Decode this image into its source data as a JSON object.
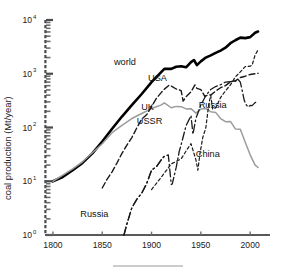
{
  "figure": {
    "background": "#ffffff",
    "rule_color": "#b9bbbd",
    "axis_color": "#58595b"
  },
  "chart_data": {
    "type": "line",
    "title": "",
    "subtitle": "",
    "xlabel": "",
    "ylabel": "coal production (Mt/year)",
    "yscale": "log",
    "xscale": "linear",
    "xlim": [
      1795,
      2012
    ],
    "ylim": [
      1,
      10000
    ],
    "grid": false,
    "legend": "inline-annotations",
    "xticks": [
      1800,
      1850,
      1900,
      1950,
      2000
    ],
    "xtick_labels": [
      "1800",
      "1850",
      "1900",
      "1950",
      "2000"
    ],
    "yticks": [
      1,
      10,
      100,
      1000,
      10000
    ],
    "ytick_labels": [
      "10⁰",
      "10¹",
      "10²",
      "10³",
      "10⁴"
    ],
    "ytick_mantissa": [
      "10",
      "10",
      "10",
      "10",
      "10"
    ],
    "ytick_exponent": [
      "0",
      "1",
      "2",
      "3",
      "4"
    ],
    "series": [
      {
        "name": "world",
        "label": "world",
        "color": "#000000",
        "width": 2.6,
        "dash": "none",
        "label_x": 1873,
        "label_y": 1450,
        "x": [
          1800,
          1810,
          1820,
          1830,
          1840,
          1850,
          1860,
          1870,
          1880,
          1890,
          1900,
          1910,
          1913,
          1920,
          1925,
          1930,
          1935,
          1940,
          1943,
          1946,
          1950,
          1955,
          1960,
          1965,
          1970,
          1975,
          1980,
          1985,
          1990,
          1995,
          2000,
          2005,
          2008
        ],
        "y": [
          10,
          12,
          16,
          22,
          33,
          55,
          95,
          160,
          260,
          420,
          700,
          1080,
          1230,
          1230,
          1350,
          1380,
          1320,
          1650,
          1800,
          1450,
          1700,
          2000,
          2200,
          2450,
          2700,
          3050,
          3700,
          4200,
          4700,
          4600,
          4800,
          5800,
          6100
        ]
      },
      {
        "name": "uk",
        "label": "UK",
        "color": "#9a9c9e",
        "width": 1.5,
        "dash": "none",
        "label_x": 1896,
        "label_y": 215,
        "x": [
          1800,
          1810,
          1820,
          1830,
          1840,
          1850,
          1860,
          1870,
          1880,
          1890,
          1900,
          1910,
          1913,
          1920,
          1925,
          1930,
          1935,
          1940,
          1945,
          1950,
          1955,
          1960,
          1965,
          1970,
          1975,
          1980,
          1985,
          1990,
          1995,
          2000,
          2005,
          2008
        ],
        "y": [
          10,
          13,
          17,
          23,
          34,
          50,
          80,
          110,
          147,
          182,
          225,
          264,
          287,
          233,
          247,
          244,
          222,
          224,
          185,
          220,
          225,
          197,
          191,
          147,
          128,
          130,
          94,
          93,
          53,
          31,
          20,
          18
        ]
      },
      {
        "name": "usa",
        "label": "USA",
        "color": "#1a1a1a",
        "width": 1.4,
        "dash": "6,3",
        "label_x": 1906,
        "label_y": 740,
        "x": [
          1850,
          1855,
          1860,
          1865,
          1870,
          1875,
          1880,
          1885,
          1890,
          1895,
          1900,
          1905,
          1910,
          1913,
          1918,
          1920,
          1925,
          1930,
          1932,
          1935,
          1940,
          1944,
          1946,
          1950,
          1954,
          1958,
          1960,
          1965,
          1970,
          1975,
          1980,
          1985,
          1990,
          1995,
          2000,
          2005,
          2008
        ],
        "y": [
          7.5,
          11,
          15,
          22,
          33,
          47,
          65,
          98,
          143,
          172,
          245,
          350,
          450,
          517,
          615,
          590,
          520,
          487,
          310,
          372,
          460,
          620,
          535,
          508,
          380,
          410,
          400,
          475,
          550,
          600,
          710,
          740,
          850,
          900,
          970,
          1000,
          1020
        ]
      },
      {
        "name": "ussr",
        "label": "USSR",
        "color": "#1a1a1a",
        "width": 1.3,
        "dash": "8,3,1.5,3",
        "label_x": 1898,
        "label_y": 118,
        "x": [
          1872,
          1875,
          1880,
          1885,
          1890,
          1895,
          1900,
          1905,
          1910,
          1913,
          1917,
          1920,
          1921,
          1925,
          1928,
          1930,
          1935,
          1940,
          1942,
          1945,
          1950,
          1955,
          1960,
          1965,
          1970,
          1975,
          1980,
          1985,
          1988
        ],
        "y": [
          1.0,
          1.6,
          3.2,
          4.6,
          6.0,
          9.0,
          16.1,
          18.7,
          25.4,
          29.2,
          31.0,
          8.7,
          8.9,
          18.1,
          35.5,
          47.8,
          108,
          166,
          75,
          149,
          261,
          391,
          510,
          578,
          624,
          701,
          716,
          726,
          772
        ]
      },
      {
        "name": "russia",
        "label": "Russia",
        "color": "#1a1a1a",
        "width": 1.3,
        "dash": "8,3,1.5,3",
        "label_x": 1962,
        "label_y": 230,
        "x": [
          1988,
          1990,
          1992,
          1994,
          1996,
          1998,
          2000,
          2002,
          2005,
          2008
        ],
        "y": [
          772,
          700,
          480,
          320,
          265,
          240,
          258,
          255,
          290,
          310
        ]
      },
      {
        "name": "china",
        "label": "China",
        "color": "#1a1a1a",
        "width": 1.2,
        "dash": "3,2.5",
        "label_x": 1957,
        "label_y": 28,
        "x": [
          1900,
          1910,
          1920,
          1930,
          1936,
          1940,
          1945,
          1947,
          1949,
          1952,
          1955,
          1958,
          1960,
          1962,
          1965,
          1970,
          1975,
          1980,
          1985,
          1990,
          1995,
          2000,
          2002,
          2005,
          2008
        ],
        "y": [
          7.0,
          12.0,
          21.0,
          26.0,
          39.0,
          50.0,
          25.0,
          16.0,
          32.0,
          66.0,
          98.0,
          270,
          397,
          220,
          232,
          360,
          482,
          620,
          872,
          1080,
          1361,
          1384,
          1455,
          2226,
          2782
        ]
      },
      {
        "name": "russia-early",
        "label": "Russia",
        "color": "#1a1a1a",
        "width": 1.3,
        "dash": "8,3,1.5,3",
        "label_x": 1842,
        "label_y": 2.2,
        "x": [
          1872,
          1875,
          1880,
          1885,
          1890,
          1895,
          1900,
          1905,
          1910,
          1913
        ],
        "y": [
          1.0,
          1.6,
          3.2,
          4.6,
          6.0,
          9.0,
          16.1,
          18.7,
          25.4,
          29.2
        ]
      }
    ],
    "annotations": [
      {
        "text": "world",
        "x": 1873,
        "y": 1450
      },
      {
        "text": "USA",
        "x": 1906,
        "y": 740
      },
      {
        "text": "UK",
        "x": 1896,
        "y": 215
      },
      {
        "text": "USSR",
        "x": 1898,
        "y": 118
      },
      {
        "text": "China",
        "x": 1957,
        "y": 28
      },
      {
        "text": "Russia",
        "x": 1962,
        "y": 230
      },
      {
        "text": "Russia",
        "x": 1842,
        "y": 2.2
      }
    ]
  }
}
